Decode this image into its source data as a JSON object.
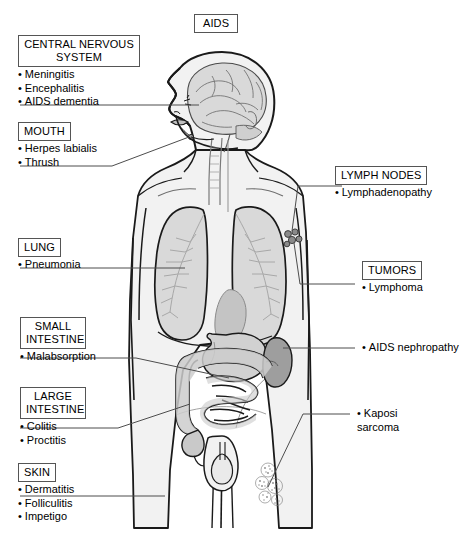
{
  "figure": {
    "title": "AIDS",
    "type": "anatomical-diagram"
  },
  "left_labels": [
    {
      "id": "cns",
      "title": "CENTRAL NERVOUS\nSYSTEM",
      "items": [
        "Meningitis",
        "Encephalitis",
        "AIDS dementia"
      ]
    },
    {
      "id": "mouth",
      "title": "MOUTH",
      "items": [
        "Herpes labialis",
        "Thrush"
      ]
    },
    {
      "id": "lung",
      "title": "LUNG",
      "items": [
        "Pneumonia"
      ]
    },
    {
      "id": "small-intestine",
      "title": "SMALL\nINTESTINE",
      "items": [
        "Malabsorption"
      ]
    },
    {
      "id": "large-intestine",
      "title": "LARGE\nINTESTINE",
      "items": [
        "Colitis",
        "Proctitis"
      ]
    },
    {
      "id": "skin",
      "title": "SKIN",
      "items": [
        "Dermatitis",
        "Folliculitis",
        "Impetigo"
      ]
    }
  ],
  "right_labels": [
    {
      "id": "lymph-nodes",
      "title": "LYMPH NODES",
      "items": [
        "Lymphadenopathy"
      ]
    },
    {
      "id": "tumors",
      "title": "TUMORS",
      "items": [
        "Lymphoma"
      ]
    }
  ],
  "right_plain_labels": [
    {
      "id": "aids-nephropathy",
      "text": "AIDS nephropathy"
    },
    {
      "id": "kaposi-sarcoma",
      "text": "Kaposi\nsarcoma"
    }
  ],
  "colors": {
    "outline": "#1a1a1a",
    "body_fill": "#f2f2f2",
    "organ_fill": "#d9d9d9",
    "organ_fill_dark": "#9e9e9e",
    "vessel": "#b3b3b3",
    "box_border": "#555555",
    "leader_line": "#4d4d4d",
    "text": "#000000",
    "background": "#ffffff"
  }
}
